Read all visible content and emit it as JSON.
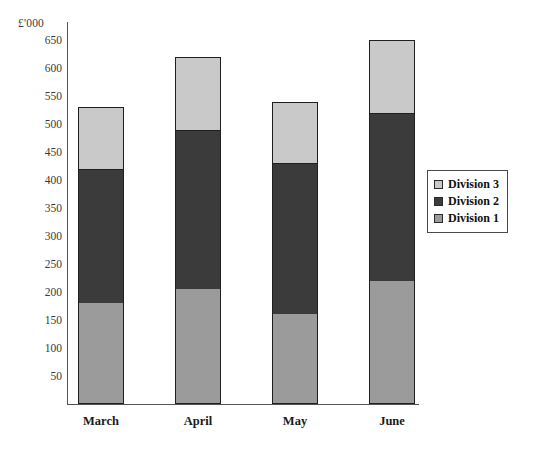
{
  "chart_data": {
    "type": "bar",
    "subtype": "stacked-column",
    "title": "",
    "xlabel": "",
    "ylabel": "£'000",
    "categories": [
      "March",
      "April",
      "May",
      "June"
    ],
    "series": [
      {
        "name": "Division 1",
        "color": "#9b9b9b",
        "values": [
          180,
          205,
          160,
          220
        ]
      },
      {
        "name": "Division 2",
        "color": "#3b3b3b",
        "values": [
          240,
          285,
          270,
          300
        ]
      },
      {
        "name": "Division 3",
        "color": "#c9c9c9",
        "values": [
          110,
          130,
          110,
          130
        ]
      }
    ],
    "totals": [
      530,
      620,
      540,
      650
    ],
    "ylim": [
      0,
      650
    ],
    "ytick_step": 50,
    "yticks": [
      50,
      100,
      150,
      200,
      250,
      300,
      350,
      400,
      450,
      500,
      550,
      600,
      650
    ],
    "ytick_labels": [
      "50",
      "100",
      "150",
      "200",
      "250",
      "300",
      "350",
      "400",
      "450",
      "500",
      "550",
      "600",
      "650"
    ],
    "grid": false,
    "legend_position": "right",
    "legend_entries": [
      "Division 3",
      "Division 2",
      "Division 1"
    ],
    "axis_unit_caption": "£'000"
  },
  "legend": {
    "items": [
      {
        "label": "Division 3",
        "swatch": "legend-swatch-division-3"
      },
      {
        "label": "Division 2",
        "swatch": "legend-swatch-division-2"
      },
      {
        "label": "Division 1",
        "swatch": "legend-swatch-division-1"
      }
    ]
  }
}
